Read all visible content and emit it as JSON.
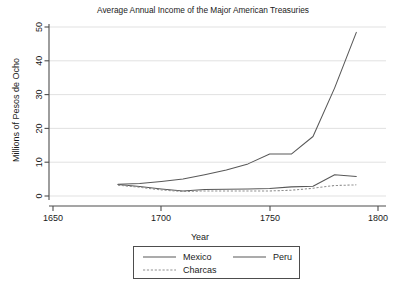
{
  "chart_data": {
    "type": "line",
    "title": "Average Annual Income of the Major American Treasuries",
    "xlabel": "Year",
    "ylabel": "Millions of Pesos de Ocho",
    "xlim": [
      1650,
      1800
    ],
    "ylim": [
      0,
      50
    ],
    "xticks": [
      1650,
      1700,
      1750,
      1800
    ],
    "yticks": [
      0,
      10,
      20,
      30,
      40,
      50
    ],
    "grid": "horizontal",
    "legend_position": "below-axis",
    "series": [
      {
        "name": "Mexico",
        "style": "solid",
        "color": "#585858",
        "x": [
          1680,
          1690,
          1700,
          1710,
          1720,
          1730,
          1740,
          1750,
          1760,
          1770,
          1780,
          1790
        ],
        "values": [
          3.5,
          3.7,
          4.3,
          5.0,
          6.3,
          7.7,
          9.5,
          12.4,
          12.4,
          17.6,
          32.0,
          48.4
        ]
      },
      {
        "name": "Peru",
        "style": "solid",
        "color": "#585858",
        "x": [
          1680,
          1690,
          1700,
          1710,
          1720,
          1730,
          1740,
          1750,
          1760,
          1770,
          1780,
          1790
        ],
        "values": [
          3.4,
          2.8,
          2.1,
          1.5,
          1.9,
          2.0,
          2.1,
          2.2,
          2.7,
          2.9,
          6.3,
          5.8
        ]
      },
      {
        "name": "Charcas",
        "style": "dotted",
        "color": "#8f8f8f",
        "x": [
          1680,
          1690,
          1700,
          1710,
          1720,
          1730,
          1740,
          1750,
          1760,
          1770,
          1780,
          1790
        ],
        "values": [
          3.2,
          2.6,
          1.8,
          1.3,
          1.5,
          1.5,
          1.5,
          1.5,
          1.7,
          2.3,
          3.1,
          3.3
        ]
      }
    ]
  },
  "legend": {
    "entries": [
      {
        "label": "Mexico"
      },
      {
        "label": "Peru"
      },
      {
        "label": "Charcas"
      }
    ]
  }
}
